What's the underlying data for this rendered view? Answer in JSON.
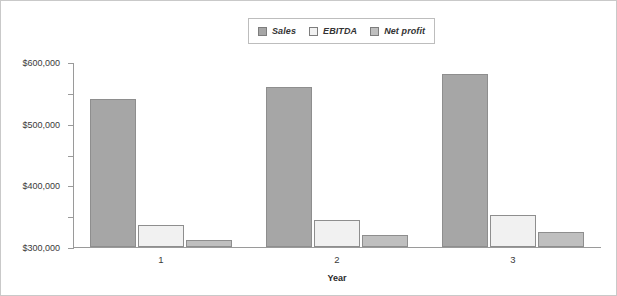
{
  "chart_data": {
    "type": "bar",
    "title": "",
    "subtitle": "",
    "xlabel": "Year",
    "ylabel": "",
    "categories": [
      "1",
      "2",
      "3"
    ],
    "series": [
      {
        "name": "Sales",
        "values": [
          480000,
          520000,
          560000
        ],
        "color": "#a6a6a6"
      },
      {
        "name": "EBITDA",
        "values": [
          72000,
          86000,
          105000
        ],
        "color": "#f1f1f1"
      },
      {
        "name": "Net profit",
        "values": [
          23000,
          38000,
          50000
        ],
        "color": "#bfbfbf"
      }
    ],
    "ylim": [
      0,
      600000
    ],
    "ytick_values": [
      0,
      100000,
      200000,
      300000,
      400000,
      500000,
      600000
    ],
    "ytick_labels": [
      "$0",
      "$100,000",
      "$200,000",
      "$300,000",
      "$400,000",
      "$500,000",
      "$600,000"
    ],
    "grid": false,
    "legend_position": "top-center",
    "annotations": []
  },
  "legend": {
    "entries": [
      {
        "label": "Sales",
        "swatch_color": "#a6a6a6"
      },
      {
        "label": "EBITDA",
        "swatch_color": "#f1f1f1"
      },
      {
        "label": "Net profit",
        "swatch_color": "#bfbfbf"
      }
    ]
  },
  "axis": {
    "x_title": "Year"
  }
}
